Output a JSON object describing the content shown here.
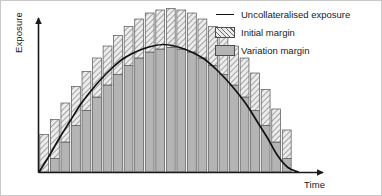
{
  "chart_data": {
    "type": "bar",
    "title": "",
    "subtitle": "",
    "xlabel": "Time",
    "ylabel": "Exposure",
    "grid": false,
    "legend_position": "top-right",
    "stacked": true,
    "axis": {
      "x_range": [
        0,
        25
      ],
      "y_range": [
        0,
        100
      ],
      "x_ticks_visible": false,
      "y_ticks_visible": false,
      "x_arrow": true,
      "y_arrow": true
    },
    "categories": [
      1,
      2,
      3,
      4,
      5,
      6,
      7,
      8,
      9,
      10,
      11,
      12,
      13,
      14,
      15,
      16,
      17,
      18,
      19,
      20,
      21,
      22,
      23,
      24
    ],
    "series": [
      {
        "name": "Variation margin",
        "type": "bar-segment",
        "fill": "solid",
        "color": "#b4b4b4",
        "values": [
          0,
          9,
          20,
          31,
          41,
          50,
          58,
          65,
          71,
          76,
          80,
          82,
          83,
          82,
          80,
          76,
          71,
          65,
          58,
          50,
          41,
          31,
          20,
          9
        ]
      },
      {
        "name": "Initial margin",
        "type": "bar-segment",
        "fill": "diagonal-hatch",
        "color": "#ececec",
        "hatch_color": "#6e6e6e",
        "values": [
          25,
          26,
          26,
          26,
          26,
          26,
          26,
          26,
          26,
          26,
          26,
          26,
          26,
          26,
          26,
          26,
          26,
          26,
          26,
          26,
          25,
          24,
          22,
          19
        ]
      },
      {
        "name": "Uncollateralised exposure",
        "type": "line",
        "color": "#111111",
        "x": [
          0,
          1,
          2,
          3,
          4,
          5,
          6,
          7,
          8,
          9,
          10,
          11,
          12,
          13,
          14,
          15,
          16,
          17,
          18,
          19,
          20,
          21,
          22,
          23,
          24,
          25
        ],
        "values": [
          0,
          11,
          23,
          34,
          45,
          54,
          62,
          69,
          75,
          79,
          82,
          84,
          85,
          84,
          82,
          79,
          75,
          69,
          62,
          54,
          45,
          34,
          23,
          11,
          3,
          0
        ]
      }
    ],
    "annotations": []
  },
  "legend": {
    "items": [
      {
        "label": "Uncollateralised exposure",
        "marker": "line",
        "swatch_class": "line-swatch"
      },
      {
        "label": "Initial margin",
        "marker": "hatched-box",
        "swatch_class": "box hatch"
      },
      {
        "label": "Variation margin",
        "marker": "solid-box",
        "swatch_class": "box solid"
      }
    ]
  },
  "colors": {
    "line": "#111111",
    "variation_margin": "#b4b4b4",
    "initial_margin_fill": "#ececec",
    "initial_margin_hatch": "#6e6e6e",
    "axis": "#1a1a1a",
    "bar_outline": "#555555",
    "background": "#ffffff",
    "frame": "#c8c8c8"
  }
}
